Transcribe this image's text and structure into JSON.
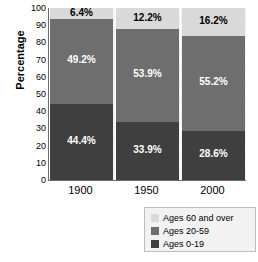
{
  "chart_data": {
    "type": "bar",
    "subtype": "stacked-bar",
    "title": "",
    "xlabel": "",
    "ylabel": "Percentage",
    "categories": [
      "1900",
      "1950",
      "2000"
    ],
    "ylim": [
      0,
      100
    ],
    "yticks": [
      0,
      10,
      20,
      30,
      40,
      50,
      60,
      70,
      80,
      90,
      100
    ],
    "ytick_labels": [
      "0",
      "10",
      "20",
      "30",
      "40",
      "50",
      "60",
      "70",
      "80",
      "90",
      "100"
    ],
    "grid": true,
    "legend_position": "bottom-right",
    "stack_order_bottom_to_top": [
      "Ages 0-19",
      "Ages 20-59",
      "Ages 60 and over"
    ],
    "series": [
      {
        "name": "Ages 0-19",
        "color": "#3f3f3f",
        "values": [
          44.4,
          33.9,
          28.6
        ],
        "labels": [
          "44.4%",
          "33.9%",
          "28.6%"
        ]
      },
      {
        "name": "Ages 20-59",
        "color": "#6e6e6e",
        "values": [
          49.2,
          53.9,
          55.2
        ],
        "labels": [
          "49.2%",
          "53.9%",
          "55.2%"
        ]
      },
      {
        "name": "Ages 60 and over",
        "color": "#d9d9d9",
        "values": [
          6.4,
          12.2,
          16.2
        ],
        "labels": [
          "6.4%",
          "12.2%",
          "16.2%"
        ]
      }
    ]
  },
  "legend": {
    "items": [
      {
        "label": "Ages 60 and over",
        "color": "#d9d9d9"
      },
      {
        "label": "Ages 20-59",
        "color": "#6e6e6e"
      },
      {
        "label": "Ages 0-19",
        "color": "#3f3f3f"
      }
    ]
  }
}
